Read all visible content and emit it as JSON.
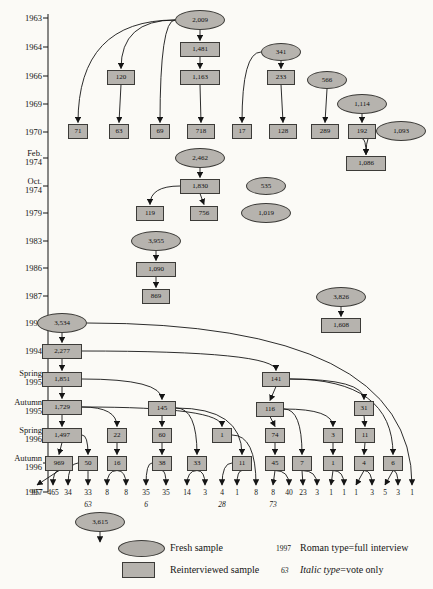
{
  "colors": {
    "background": "#fbfaf6",
    "node_fill": "#b6b3ae",
    "node_border": "#3c3b38",
    "line": "#151515"
  },
  "legend": {
    "fresh_label": "Fresh sample",
    "reinterviewed_label": "Reinterviewed sample",
    "roman_key": "1997",
    "roman_label": "Roman type=full interview",
    "italic_key": "63",
    "italic_label_italic": "Italic type",
    "italic_label_rest": "=vote only"
  },
  "axis": {
    "x": 48,
    "top": 14,
    "bottom": 492,
    "labels": [
      {
        "text": "1963",
        "y": 18
      },
      {
        "text": "1964",
        "y": 47
      },
      {
        "text": "1966",
        "y": 76
      },
      {
        "text": "1969",
        "y": 104
      },
      {
        "text": "1970",
        "y": 132
      },
      {
        "text": "Feb.\n1974",
        "y": 158
      },
      {
        "text": "Oct.\n1974",
        "y": 186
      },
      {
        "text": "1979",
        "y": 213
      },
      {
        "text": "1983",
        "y": 241
      },
      {
        "text": "1986",
        "y": 268
      },
      {
        "text": "1987",
        "y": 296
      },
      {
        "text": "1992",
        "y": 323
      },
      {
        "text": "1994",
        "y": 351
      },
      {
        "text": "Spring\n1995",
        "y": 378
      },
      {
        "text": "Autumn\n1995",
        "y": 407
      },
      {
        "text": "Spring\n1996",
        "y": 435
      },
      {
        "text": "Autumn\n1996",
        "y": 463
      },
      {
        "text": "1997",
        "y": 492
      }
    ]
  },
  "nodes": [
    {
      "id": "n63",
      "type": "fresh",
      "label": "2,009",
      "x": 200,
      "y": 20
    },
    {
      "id": "n64p",
      "type": "reint",
      "label": "1,481",
      "x": 200,
      "y": 49
    },
    {
      "id": "n64f",
      "type": "fresh",
      "label": "341",
      "x": 281,
      "y": 52
    },
    {
      "id": "n66a",
      "type": "reint",
      "label": "120",
      "x": 121,
      "y": 77
    },
    {
      "id": "n66p",
      "type": "reint",
      "label": "1,163",
      "x": 200,
      "y": 77
    },
    {
      "id": "n66b",
      "type": "reint",
      "label": "233",
      "x": 281,
      "y": 77
    },
    {
      "id": "n66f",
      "type": "fresh",
      "label": "566",
      "x": 327,
      "y": 80
    },
    {
      "id": "n69f",
      "type": "fresh",
      "label": "1,114",
      "x": 362,
      "y": 104
    },
    {
      "id": "n70a",
      "type": "reint",
      "label": "71",
      "x": 78,
      "y": 131
    },
    {
      "id": "n70b",
      "type": "reint",
      "label": "63",
      "x": 119,
      "y": 131
    },
    {
      "id": "n70c",
      "type": "reint",
      "label": "69",
      "x": 160,
      "y": 131
    },
    {
      "id": "n70d",
      "type": "reint",
      "label": "718",
      "x": 201,
      "y": 131
    },
    {
      "id": "n70e",
      "type": "reint",
      "label": "17",
      "x": 242,
      "y": 131
    },
    {
      "id": "n70f",
      "type": "reint",
      "label": "128",
      "x": 283,
      "y": 131
    },
    {
      "id": "n70g",
      "type": "reint",
      "label": "289",
      "x": 325,
      "y": 131
    },
    {
      "id": "n70h",
      "type": "reint",
      "label": "192",
      "x": 362,
      "y": 131
    },
    {
      "id": "n70i",
      "type": "fresh",
      "label": "1,093",
      "x": 401,
      "y": 131
    },
    {
      "id": "n74f",
      "type": "fresh",
      "label": "2,462",
      "x": 200,
      "y": 158
    },
    {
      "id": "n74p",
      "type": "reint",
      "label": "1,086",
      "x": 366,
      "y": 163
    },
    {
      "id": "no74p",
      "type": "reint",
      "label": "1,830",
      "x": 200,
      "y": 186
    },
    {
      "id": "no74f",
      "type": "fresh",
      "label": "535",
      "x": 266,
      "y": 186
    },
    {
      "id": "n79a",
      "type": "reint",
      "label": "119",
      "x": 150,
      "y": 213
    },
    {
      "id": "n79b",
      "type": "reint",
      "label": "756",
      "x": 204,
      "y": 213
    },
    {
      "id": "n79f",
      "type": "fresh",
      "label": "1,019",
      "x": 266,
      "y": 213
    },
    {
      "id": "n83f",
      "type": "fresh",
      "label": "3,955",
      "x": 156,
      "y": 241
    },
    {
      "id": "n86p",
      "type": "reint",
      "label": "1,090",
      "x": 156,
      "y": 269
    },
    {
      "id": "n87p",
      "type": "reint",
      "label": "869",
      "x": 156,
      "y": 296
    },
    {
      "id": "n87f",
      "type": "fresh",
      "label": "3,826",
      "x": 341,
      "y": 297
    },
    {
      "id": "n92p",
      "type": "reint",
      "label": "1,608",
      "x": 341,
      "y": 325
    },
    {
      "id": "n92f",
      "type": "fresh",
      "label": "3,534",
      "x": 62,
      "y": 323
    },
    {
      "id": "n94",
      "type": "reint",
      "label": "2,277",
      "x": 62,
      "y": 351
    },
    {
      "id": "ns95",
      "type": "reint",
      "label": "1,851",
      "x": 62,
      "y": 379
    },
    {
      "id": "ns95b",
      "type": "reint",
      "label": "141",
      "x": 276,
      "y": 379
    },
    {
      "id": "na95",
      "type": "reint",
      "label": "1,729",
      "x": 62,
      "y": 407
    },
    {
      "id": "na95b",
      "type": "reint",
      "label": "145",
      "x": 162,
      "y": 408
    },
    {
      "id": "na95c",
      "type": "reint",
      "label": "116",
      "x": 270,
      "y": 409
    },
    {
      "id": "na95d",
      "type": "reint",
      "label": "31",
      "x": 364,
      "y": 408
    },
    {
      "id": "ns96",
      "type": "reint",
      "label": "1,497",
      "x": 62,
      "y": 435
    },
    {
      "id": "ns96b",
      "type": "reint",
      "label": "22",
      "x": 117,
      "y": 435
    },
    {
      "id": "ns96c",
      "type": "reint",
      "label": "60",
      "x": 162,
      "y": 435
    },
    {
      "id": "ns96d",
      "type": "reint",
      "label": "1",
      "x": 222,
      "y": 435
    },
    {
      "id": "ns96e",
      "type": "reint",
      "label": "74",
      "x": 275,
      "y": 435
    },
    {
      "id": "ns96f",
      "type": "reint",
      "label": "3",
      "x": 333,
      "y": 435
    },
    {
      "id": "ns96g",
      "type": "reint",
      "label": "11",
      "x": 365,
      "y": 435
    },
    {
      "id": "na96a",
      "type": "reint",
      "label": "969",
      "x": 59,
      "y": 463
    },
    {
      "id": "na96b",
      "type": "reint",
      "label": "50",
      "x": 88,
      "y": 463
    },
    {
      "id": "na96c",
      "type": "reint",
      "label": "16",
      "x": 117,
      "y": 463
    },
    {
      "id": "na96d",
      "type": "reint",
      "label": "38",
      "x": 162,
      "y": 463
    },
    {
      "id": "na96e",
      "type": "reint",
      "label": "33",
      "x": 197,
      "y": 463
    },
    {
      "id": "na96f",
      "type": "reint",
      "label": "11",
      "x": 242,
      "y": 463
    },
    {
      "id": "na96g",
      "type": "reint",
      "label": "45",
      "x": 275,
      "y": 463
    },
    {
      "id": "na96h",
      "type": "reint",
      "label": "7",
      "x": 302,
      "y": 463
    },
    {
      "id": "na96i",
      "type": "reint",
      "label": "1",
      "x": 333,
      "y": 463
    },
    {
      "id": "na96j",
      "type": "reint",
      "label": "4",
      "x": 364,
      "y": 463
    },
    {
      "id": "na96k",
      "type": "reint",
      "label": "6",
      "x": 393,
      "y": 463
    },
    {
      "id": "n97f",
      "type": "fresh",
      "label": "3,615",
      "x": 100,
      "y": 522
    }
  ],
  "bottom_row": {
    "y": 488,
    "values": [
      {
        "v": "957",
        "x": 37
      },
      {
        "v": "465",
        "x": 53
      },
      {
        "v": "34",
        "x": 68
      },
      {
        "v": "33",
        "x": 88
      },
      {
        "v": "8",
        "x": 107
      },
      {
        "v": "8",
        "x": 126
      },
      {
        "v": "35",
        "x": 146
      },
      {
        "v": "35",
        "x": 166
      },
      {
        "v": "14",
        "x": 187
      },
      {
        "v": "3",
        "x": 205
      },
      {
        "v": "4",
        "x": 222
      },
      {
        "v": "1",
        "x": 237
      },
      {
        "v": "8",
        "x": 256
      },
      {
        "v": "8",
        "x": 273
      },
      {
        "v": "40",
        "x": 289
      },
      {
        "v": "23",
        "x": 303
      },
      {
        "v": "3",
        "x": 317
      },
      {
        "v": "1",
        "x": 331
      },
      {
        "v": "1",
        "x": 344
      },
      {
        "v": "1",
        "x": 356
      },
      {
        "v": "3",
        "x": 372
      },
      {
        "v": "5",
        "x": 385
      },
      {
        "v": "3",
        "x": 398
      },
      {
        "v": "1",
        "x": 412
      }
    ],
    "italic_values": [
      {
        "v": "63",
        "x": 88
      },
      {
        "v": "6",
        "x": 146
      },
      {
        "v": "28",
        "x": 222
      },
      {
        "v": "73",
        "x": 273
      }
    ]
  },
  "edges": [
    [
      "n63",
      "n64p",
      "v"
    ],
    [
      "n63",
      "n66a",
      "c"
    ],
    [
      "n63",
      "n70a",
      "c"
    ],
    [
      "n63",
      "n70c",
      "c"
    ],
    [
      "n64p",
      "n66p",
      "v"
    ],
    [
      "n66a",
      "n70b",
      "v"
    ],
    [
      "n66p",
      "n70d",
      "v"
    ],
    [
      "n64f",
      "n66b",
      "v"
    ],
    [
      "n64f",
      "n70e",
      "c"
    ],
    [
      "n66b",
      "n70f",
      "v"
    ],
    [
      "n66f",
      "n70g",
      "v"
    ],
    [
      "n69f",
      "n70h",
      "v"
    ],
    [
      "n70h",
      "n74p",
      "c"
    ],
    [
      "n70i",
      "n74p",
      "c"
    ],
    [
      "n74f",
      "no74p",
      "v"
    ],
    [
      "no74p",
      "n79a",
      "c"
    ],
    [
      "no74p",
      "n79b",
      "v"
    ],
    [
      "n83f",
      "n86p",
      "v"
    ],
    [
      "n86p",
      "n87p",
      "v"
    ],
    [
      "n87f",
      "n92p",
      "v"
    ],
    [
      "n92f",
      "n94",
      "v"
    ],
    [
      "n92f",
      "@p23",
      "c"
    ],
    [
      "n94",
      "ns95",
      "v"
    ],
    [
      "n94",
      "ns95b",
      "c"
    ],
    [
      "ns95",
      "na95",
      "v"
    ],
    [
      "ns95",
      "na95b",
      "c"
    ],
    [
      "na95",
      "ns96",
      "v"
    ],
    [
      "na95",
      "ns96b",
      "c"
    ],
    [
      "na95",
      "ns96d",
      "c"
    ],
    [
      "ns96",
      "na96a",
      "v"
    ],
    [
      "ns96",
      "na96b",
      "c"
    ],
    [
      "ns95b",
      "na95c",
      "v"
    ],
    [
      "ns95b",
      "na95d",
      "c"
    ],
    [
      "ns95b",
      "na96k",
      "c"
    ],
    [
      "na95b",
      "ns96c",
      "v"
    ],
    [
      "na95b",
      "na96e",
      "c"
    ],
    [
      "na95b",
      "na96f",
      "c"
    ],
    [
      "na95c",
      "ns96e",
      "v"
    ],
    [
      "na95c",
      "ns96f",
      "c"
    ],
    [
      "na95c",
      "na96h",
      "c"
    ],
    [
      "na95d",
      "ns96g",
      "v"
    ],
    [
      "ns96b",
      "na96c",
      "v"
    ],
    [
      "ns96c",
      "na96d",
      "v"
    ],
    [
      "ns96e",
      "na96g",
      "v"
    ],
    [
      "ns96f",
      "na96i",
      "v"
    ],
    [
      "ns96g",
      "na96j",
      "v"
    ],
    [
      "na96a",
      "@p0",
      "v"
    ],
    [
      "na96a",
      "@p1",
      "c"
    ],
    [
      "na96b",
      "@p2",
      "c"
    ],
    [
      "na96b",
      "@p3",
      "c"
    ],
    [
      "na96c",
      "@p4",
      "c"
    ],
    [
      "na96c",
      "@p5",
      "c"
    ],
    [
      "na96d",
      "@p6",
      "c"
    ],
    [
      "na96d",
      "@p7",
      "c"
    ],
    [
      "na96e",
      "@p8",
      "c"
    ],
    [
      "na96e",
      "@p9",
      "c"
    ],
    [
      "na96f",
      "@p10",
      "c"
    ],
    [
      "na96f",
      "@p11",
      "c"
    ],
    [
      "ns96d",
      "@p12",
      "c"
    ],
    [
      "na96g",
      "@p13",
      "v"
    ],
    [
      "na96g",
      "@p14",
      "c"
    ],
    [
      "na96h",
      "@p15",
      "v"
    ],
    [
      "na96h",
      "@p16",
      "c"
    ],
    [
      "na96i",
      "@p17",
      "v"
    ],
    [
      "na96i",
      "@p18",
      "c"
    ],
    [
      "na96j",
      "@p19",
      "v"
    ],
    [
      "na96j",
      "@p20",
      "c"
    ],
    [
      "na96k",
      "@p21",
      "v"
    ],
    [
      "na96k",
      "@p22",
      "c"
    ],
    [
      "n97f",
      "@stub",
      "v"
    ]
  ]
}
